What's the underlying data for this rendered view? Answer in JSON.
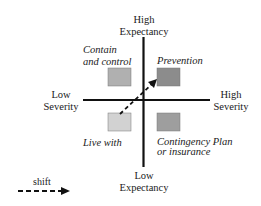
{
  "axes": {
    "top": [
      "High",
      "Expectancy"
    ],
    "bottom": [
      "Low",
      "Expectancy"
    ],
    "left": [
      "Low",
      "Severity"
    ],
    "right": [
      "High",
      "Severity"
    ]
  },
  "quadrants": {
    "top_left": {
      "label": [
        "Contain",
        "and control"
      ],
      "color": "#b0b0b0"
    },
    "top_right": {
      "label": [
        "Prevention"
      ],
      "color": "#8c8c8c"
    },
    "bottom_left": {
      "label": [
        "Live with"
      ],
      "color": "#d2d2d2"
    },
    "bottom_right": {
      "label": [
        "Contingency Plan",
        "or insurance"
      ],
      "color": "#9e9e9e"
    }
  },
  "legend": {
    "label": "shift"
  }
}
